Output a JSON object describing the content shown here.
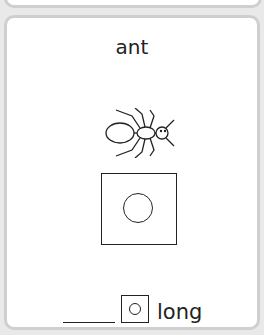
{
  "card": {
    "word": "ant",
    "picture_icon": "ant-icon",
    "sound_box_icon": "circle-in-square-icon",
    "answer": {
      "blank": "____",
      "box_icon": "circle-in-square-icon",
      "suffix": "long"
    }
  }
}
